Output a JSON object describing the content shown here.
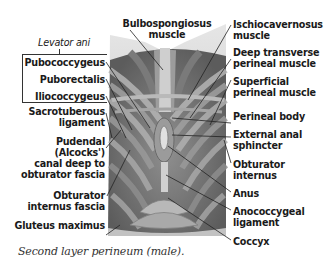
{
  "figure": {
    "caption": "Second layer perineum (male).",
    "group_label": "Levator ani",
    "group_members": [
      {
        "label": "Pubococcygeus"
      },
      {
        "label": "Puborectalis"
      },
      {
        "label": "Iliococcygeus"
      }
    ],
    "top_label": {
      "line1": "Bulbospongiosus",
      "line2": "muscle"
    },
    "left_labels": [
      {
        "line1": "Sacrotuberous",
        "line2": "ligament"
      },
      {
        "line1": "Pudendal",
        "line2": "(Alcocks')",
        "line3": "canal deep to",
        "line4": "obturator fascia"
      },
      {
        "line1": "Obturator",
        "line2": "internus fascia"
      },
      {
        "line1": "Gluteus maximus"
      }
    ],
    "right_labels": [
      {
        "line1": "Ischiocavernosus",
        "line2": "muscle"
      },
      {
        "line1": "Deep transverse",
        "line2": "perineal muscle"
      },
      {
        "line1": "Superficial",
        "line2": "perineal muscle"
      },
      {
        "line1": "Perineal body"
      },
      {
        "line1": "External anal",
        "line2": "sphincter"
      },
      {
        "line1": "Obturator",
        "line2": "internus"
      },
      {
        "line1": "Anus"
      },
      {
        "line1": "Anococcygeal",
        "line2": "ligament"
      },
      {
        "line1": "Coccyx"
      }
    ],
    "colors": {
      "label_text": "#1a1a1a",
      "leader_line": "#222222",
      "muscle_dark": "#5a5a5a",
      "muscle_mid": "#8a8a8a",
      "muscle_light": "#c8c8c8",
      "background_shape": "#d9d9d9"
    }
  }
}
